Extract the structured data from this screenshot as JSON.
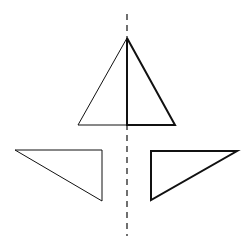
{
  "diagram": {
    "colors": {
      "background": "#ffffff",
      "stroke": "#111111"
    },
    "axis": {
      "x": 127,
      "y1": 14,
      "y2": 236,
      "dash": "6 5",
      "stroke_width": 1.2
    },
    "top_triangle": {
      "left_half": {
        "points": "127,38 78,125 127,125",
        "stroke_width": 1
      },
      "right_half": {
        "points": "127,38 175,125 127,125",
        "stroke_width": 2
      }
    },
    "left_triangle": {
      "points": "15,150 102,150 102,201",
      "stroke_width": 1
    },
    "right_triangle": {
      "points": "151,151 237,151 151,200",
      "stroke_width": 2
    }
  }
}
